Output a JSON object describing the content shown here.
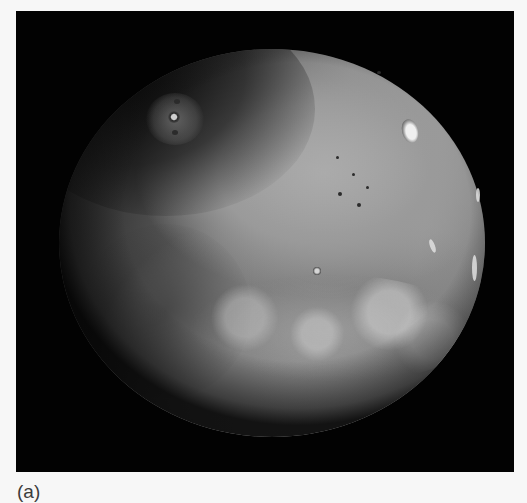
{
  "figure": {
    "caption": "(a)",
    "colors": {
      "page_background": "#f7f7f7",
      "frame_background": "#020202",
      "planet_light": "#a9a9a9",
      "planet_dark": "#1e1e1e",
      "caption_text": "#3c3c3c"
    }
  }
}
